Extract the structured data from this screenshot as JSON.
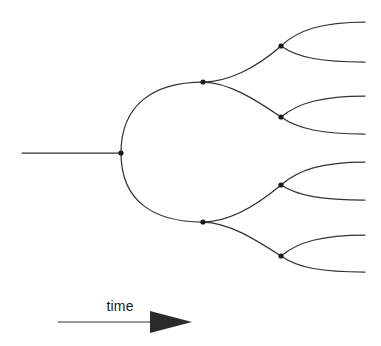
{
  "figure": {
    "background_color": "#ffffff",
    "line_color": "#333333",
    "node_color": "#1a1a1a",
    "width": 381,
    "height": 346
  },
  "axis": {
    "label": "time",
    "label_x": 120,
    "label_y": 311,
    "line_x1": 58,
    "line_x2": 152,
    "line_y": 322,
    "arrow_tip_x": 192,
    "arrow_back_x": 150,
    "arrow_half_height": 11,
    "icon": "arrow-right-icon"
  },
  "chart_data": {
    "type": "tree",
    "title": "",
    "xlabel": "time",
    "ylabel": "",
    "levels": 3,
    "root": {
      "x": 121,
      "y": 153
    },
    "trunk": {
      "x_start": 22,
      "x_end": 121,
      "y": 153
    },
    "nodes": [
      {
        "id": "n0",
        "level": 0,
        "x": 121,
        "y": 153
      },
      {
        "id": "n1u",
        "level": 1,
        "x": 203,
        "y": 82
      },
      {
        "id": "n1d",
        "level": 1,
        "x": 203,
        "y": 222
      },
      {
        "id": "n2uu",
        "level": 2,
        "x": 281,
        "y": 46
      },
      {
        "id": "n2ud",
        "level": 2,
        "x": 281,
        "y": 117
      },
      {
        "id": "n2du",
        "level": 2,
        "x": 281,
        "y": 185
      },
      {
        "id": "n2dd",
        "level": 2,
        "x": 281,
        "y": 256
      }
    ],
    "tips": [
      {
        "id": "t1",
        "x": 365,
        "y": 22
      },
      {
        "id": "t2",
        "x": 365,
        "y": 62
      },
      {
        "id": "t3",
        "x": 365,
        "y": 96
      },
      {
        "id": "t4",
        "x": 365,
        "y": 134
      },
      {
        "id": "t5",
        "x": 365,
        "y": 162
      },
      {
        "id": "t6",
        "x": 365,
        "y": 200
      },
      {
        "id": "t7",
        "x": 365,
        "y": 235
      },
      {
        "id": "t8",
        "x": 365,
        "y": 272
      }
    ],
    "edges": [
      {
        "from": "n0",
        "to": "n1u",
        "d": "M121,153 C121,106 152,82 203,82"
      },
      {
        "from": "n0",
        "to": "n1d",
        "d": "M121,153 C121,200 152,222 203,222"
      },
      {
        "from": "n1u",
        "to": "n2uu",
        "d": "M203,82 C228,82 256,68 281,46"
      },
      {
        "from": "n1u",
        "to": "n2ud",
        "d": "M203,82 C228,82 256,100 281,117"
      },
      {
        "from": "n1d",
        "to": "n2du",
        "d": "M203,222 C228,222 256,206 281,185"
      },
      {
        "from": "n1d",
        "to": "n2dd",
        "d": "M203,222 C228,222 256,240 281,256"
      },
      {
        "from": "n2uu",
        "to": "t1",
        "d": "M281,46 C298,30 322,22 365,22"
      },
      {
        "from": "n2uu",
        "to": "t2",
        "d": "M281,46 C298,58 322,62 365,62"
      },
      {
        "from": "n2ud",
        "to": "t3",
        "d": "M281,117 C298,103 322,96 365,96"
      },
      {
        "from": "n2ud",
        "to": "t4",
        "d": "M281,117 C298,129 322,134 365,134"
      },
      {
        "from": "n2du",
        "to": "t5",
        "d": "M281,185 C298,170 322,162 365,162"
      },
      {
        "from": "n2du",
        "to": "t6",
        "d": "M281,185 C298,196 322,200 365,200"
      },
      {
        "from": "n2dd",
        "to": "t7",
        "d": "M281,256 C298,242 322,235 365,235"
      },
      {
        "from": "n2dd",
        "to": "t8",
        "d": "M281,256 C298,268 322,272 365,272"
      }
    ],
    "node_radius": 2.6,
    "annotations": [
      "time"
    ]
  }
}
